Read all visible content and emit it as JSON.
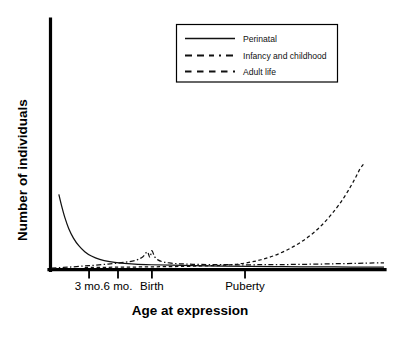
{
  "chart_data": {
    "type": "line",
    "title": "",
    "xlabel": "Age at expression",
    "ylabel": "Number of individuals",
    "grid": false,
    "legend_position": "top-center",
    "xlim": [
      0,
      100
    ],
    "ylim": [
      0,
      100
    ],
    "tick_labels": [
      {
        "label": "3 mo.",
        "x_frac": 0.113
      },
      {
        "label": "6 mo.",
        "x_frac": 0.2
      },
      {
        "label": "Birth",
        "x_frac": 0.302
      },
      {
        "label": "Puberty",
        "x_frac": 0.582
      }
    ],
    "axis_note": "Axes are unlabeled qualitative scales; no numeric tick values are printed.",
    "series": [
      {
        "name": "Perinatal",
        "style": "solid",
        "description": "Steep exponential decay from a high value at the left edge, flattening to near zero by about the 6 mo. tick.",
        "points": [
          [
            0.022,
            0.46
          ],
          [
            0.03,
            0.392
          ],
          [
            0.04,
            0.318
          ],
          [
            0.052,
            0.248
          ],
          [
            0.066,
            0.19
          ],
          [
            0.082,
            0.143
          ],
          [
            0.1,
            0.106
          ],
          [
            0.12,
            0.079
          ],
          [
            0.145,
            0.058
          ],
          [
            0.175,
            0.044
          ],
          [
            0.21,
            0.035
          ],
          [
            0.25,
            0.029
          ],
          [
            0.3,
            0.025
          ],
          [
            0.36,
            0.022
          ],
          [
            0.43,
            0.019
          ],
          [
            0.51,
            0.017
          ],
          [
            0.6,
            0.015
          ],
          [
            0.7,
            0.013
          ],
          [
            0.8,
            0.012
          ],
          [
            0.9,
            0.011
          ],
          [
            1.0,
            0.01
          ]
        ]
      },
      {
        "name": "Infancy and childhood",
        "style": "dash-dot",
        "description": "Low gentle rise from the origin to a sharp narrow peak centred on Birth, then decay back toward the baseline with a slight late upturn.",
        "points": [
          [
            0.0,
            0.004
          ],
          [
            0.05,
            0.01
          ],
          [
            0.11,
            0.019
          ],
          [
            0.17,
            0.029
          ],
          [
            0.22,
            0.04
          ],
          [
            0.255,
            0.054
          ],
          [
            0.275,
            0.075
          ],
          [
            0.288,
            0.105
          ],
          [
            0.296,
            0.07
          ],
          [
            0.302,
            0.112
          ],
          [
            0.31,
            0.075
          ],
          [
            0.32,
            0.055
          ],
          [
            0.335,
            0.043
          ],
          [
            0.355,
            0.036
          ],
          [
            0.385,
            0.031
          ],
          [
            0.425,
            0.028
          ],
          [
            0.48,
            0.026
          ],
          [
            0.545,
            0.025
          ],
          [
            0.615,
            0.025
          ],
          [
            0.69,
            0.026
          ],
          [
            0.77,
            0.028
          ],
          [
            0.85,
            0.031
          ],
          [
            0.92,
            0.034
          ],
          [
            0.97,
            0.036
          ],
          [
            1.0,
            0.036
          ]
        ]
      },
      {
        "name": "Adult life",
        "style": "dashed",
        "description": "Essentially flat on the baseline until just before Puberty, then a strong exponential rise to the upper right of the plot.",
        "points": [
          [
            0.1,
            0.008
          ],
          [
            0.2,
            0.01
          ],
          [
            0.3,
            0.012
          ],
          [
            0.4,
            0.015
          ],
          [
            0.48,
            0.019
          ],
          [
            0.545,
            0.026
          ],
          [
            0.59,
            0.038
          ],
          [
            0.63,
            0.056
          ],
          [
            0.67,
            0.082
          ],
          [
            0.71,
            0.118
          ],
          [
            0.75,
            0.165
          ],
          [
            0.79,
            0.226
          ],
          [
            0.825,
            0.296
          ],
          [
            0.855,
            0.37
          ],
          [
            0.88,
            0.442
          ],
          [
            0.9,
            0.51
          ],
          [
            0.915,
            0.566
          ],
          [
            0.928,
            0.618
          ],
          [
            0.938,
            0.645
          ]
        ]
      }
    ],
    "legend_entries": [
      {
        "label": "Perinatal",
        "style": "solid"
      },
      {
        "label": "Infancy and childhood",
        "style": "dash-dot"
      },
      {
        "label": "Adult life",
        "style": "dashed"
      }
    ]
  },
  "colors": {
    "background": "#ffffff",
    "axis": "#000000",
    "curve": "#111111",
    "text": "#000000"
  }
}
